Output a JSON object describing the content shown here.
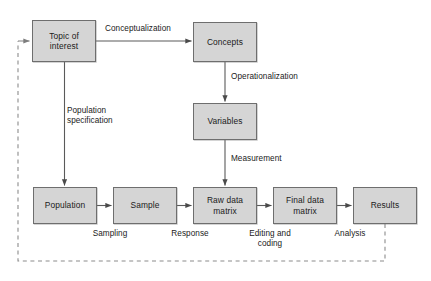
{
  "diagram": {
    "style": {
      "node_fill": "#d5d5d5",
      "node_border": "#6e6e6e",
      "connector_color": "#5a5a5a",
      "dashed_color": "#8c8c8c",
      "background": "#ffffff"
    },
    "nodes": [
      {
        "id": "topic",
        "label": "Topic of\ninterest",
        "x": 32,
        "y": 20,
        "w": 64,
        "h": 42
      },
      {
        "id": "concepts",
        "label": "Concepts",
        "x": 193,
        "y": 22,
        "w": 64,
        "h": 40
      },
      {
        "id": "variables",
        "label": "Variables",
        "x": 193,
        "y": 103,
        "w": 64,
        "h": 37
      },
      {
        "id": "population",
        "label": "Population",
        "x": 33,
        "y": 187,
        "w": 64,
        "h": 37
      },
      {
        "id": "sample",
        "label": "Sample",
        "x": 113,
        "y": 187,
        "w": 64,
        "h": 37
      },
      {
        "id": "rawdata",
        "label": "Raw data\nmatrix",
        "x": 193,
        "y": 187,
        "w": 64,
        "h": 37
      },
      {
        "id": "finaldata",
        "label": "Final data\nmatrix",
        "x": 273,
        "y": 187,
        "w": 64,
        "h": 37
      },
      {
        "id": "results",
        "label": "Results",
        "x": 353,
        "y": 187,
        "w": 64,
        "h": 37
      }
    ],
    "edge_labels": [
      {
        "id": "conceptualization",
        "text": "Conceptualization",
        "x": 105,
        "y": 24,
        "w": 95,
        "align": "left"
      },
      {
        "id": "operationalization",
        "text": "Operationalization",
        "x": 231,
        "y": 72,
        "w": 95,
        "align": "left"
      },
      {
        "id": "population-specification",
        "text": "Population\nspecification",
        "x": 67,
        "y": 106,
        "w": 80,
        "align": "left"
      },
      {
        "id": "measurement",
        "text": "Measurement",
        "x": 231,
        "y": 154,
        "w": 80,
        "align": "left"
      },
      {
        "id": "sampling",
        "text": "Sampling",
        "x": 80,
        "y": 229,
        "w": 60,
        "align": "center"
      },
      {
        "id": "response",
        "text": "Response",
        "x": 160,
        "y": 229,
        "w": 60,
        "align": "center"
      },
      {
        "id": "editing-and-coding",
        "text": "Editing and\ncoding",
        "x": 240,
        "y": 229,
        "w": 60,
        "align": "center"
      },
      {
        "id": "analysis",
        "text": "Analysis",
        "x": 320,
        "y": 229,
        "w": 60,
        "align": "center"
      }
    ],
    "connectors": [
      {
        "id": "topic-to-concepts",
        "from": "topic",
        "to": "concepts",
        "kind": "solid-arrow",
        "direction": "right"
      },
      {
        "id": "concepts-to-variables",
        "from": "concepts",
        "to": "variables",
        "kind": "solid-arrow",
        "direction": "down"
      },
      {
        "id": "variables-to-rawdata",
        "from": "variables",
        "to": "rawdata",
        "kind": "solid-arrow",
        "direction": "down"
      },
      {
        "id": "topic-to-population",
        "from": "topic",
        "to": "population",
        "kind": "solid-arrow",
        "direction": "down"
      },
      {
        "id": "population-to-sample",
        "from": "population",
        "to": "sample",
        "kind": "solid-arrow",
        "direction": "right"
      },
      {
        "id": "sample-to-rawdata",
        "from": "sample",
        "to": "rawdata",
        "kind": "solid-arrow",
        "direction": "right"
      },
      {
        "id": "rawdata-to-finaldata",
        "from": "rawdata",
        "to": "finaldata",
        "kind": "solid-arrow",
        "direction": "right"
      },
      {
        "id": "finaldata-to-results",
        "from": "finaldata",
        "to": "results",
        "kind": "solid-arrow",
        "direction": "right"
      },
      {
        "id": "results-feedback-to-topic",
        "from": "results",
        "to": "topic",
        "kind": "dashed-arrow",
        "direction": "loop-left"
      }
    ]
  }
}
